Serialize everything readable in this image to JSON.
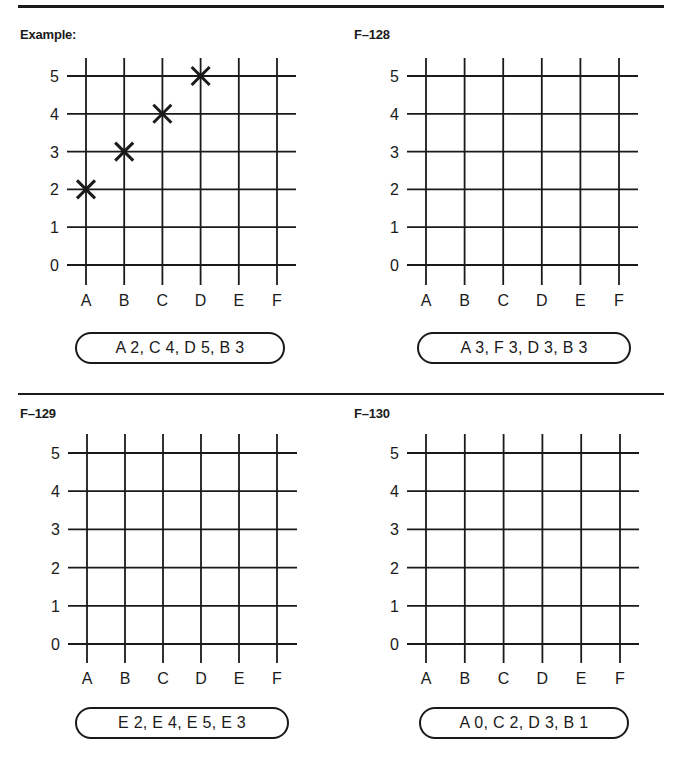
{
  "page": {
    "axis_x_labels": [
      "A",
      "B",
      "C",
      "D",
      "E",
      "F"
    ],
    "axis_y_labels": [
      "0",
      "1",
      "2",
      "3",
      "4",
      "5"
    ]
  },
  "panels": [
    {
      "title": "Example:",
      "coordinates_label": "A 2, C 4, D 5, B 3",
      "marked_points": [
        [
          "A",
          2
        ],
        [
          "B",
          3
        ],
        [
          "C",
          4
        ],
        [
          "D",
          5
        ]
      ]
    },
    {
      "title": "F–128",
      "coordinates_label": "A 3, F 3, D 3, B 3",
      "marked_points": []
    },
    {
      "title": "F–129",
      "coordinates_label": "E 2, E 4, E 5, E 3",
      "marked_points": []
    },
    {
      "title": "F–130",
      "coordinates_label": "A 0, C 2, D 3, B 1",
      "marked_points": []
    }
  ],
  "colors": {
    "ink": "#1a1a1a",
    "paper": "#ffffff"
  },
  "chart_data": [
    {
      "type": "scatter",
      "title": "Example:",
      "categories_x": [
        "A",
        "B",
        "C",
        "D",
        "E",
        "F"
      ],
      "y_ticks": [
        0,
        1,
        2,
        3,
        4,
        5
      ],
      "points": [
        {
          "x": "A",
          "y": 2
        },
        {
          "x": "C",
          "y": 4
        },
        {
          "x": "D",
          "y": 5
        },
        {
          "x": "B",
          "y": 3
        }
      ],
      "marker": "X",
      "grid": true,
      "caption": "A 2, C 4, D 5, B 3"
    },
    {
      "type": "scatter",
      "title": "F–128",
      "categories_x": [
        "A",
        "B",
        "C",
        "D",
        "E",
        "F"
      ],
      "y_ticks": [
        0,
        1,
        2,
        3,
        4,
        5
      ],
      "points": [],
      "grid": true,
      "caption": "A 3, F 3, D 3, B 3"
    },
    {
      "type": "scatter",
      "title": "F–129",
      "categories_x": [
        "A",
        "B",
        "C",
        "D",
        "E",
        "F"
      ],
      "y_ticks": [
        0,
        1,
        2,
        3,
        4,
        5
      ],
      "points": [],
      "grid": true,
      "caption": "E 2, E 4, E 5, E 3"
    },
    {
      "type": "scatter",
      "title": "F–130",
      "categories_x": [
        "A",
        "B",
        "C",
        "D",
        "E",
        "F"
      ],
      "y_ticks": [
        0,
        1,
        2,
        3,
        4,
        5
      ],
      "points": [],
      "grid": true,
      "caption": "A 0, C 2, D 3, B 1"
    }
  ]
}
